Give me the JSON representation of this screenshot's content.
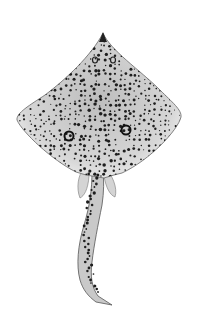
{
  "image": {
    "subject": "spotted skate illustration",
    "description": "Dorsal view of a ray/skate with a diamond-shaped disc covered in dark spots, two eye-spot rings on the wings, and a long spotted tail",
    "colors": {
      "background": "#ffffff",
      "disc": "#d9d9d9",
      "disc_edge": "#efefef",
      "spots": "#1e1e1e",
      "outline": "#555555"
    }
  }
}
